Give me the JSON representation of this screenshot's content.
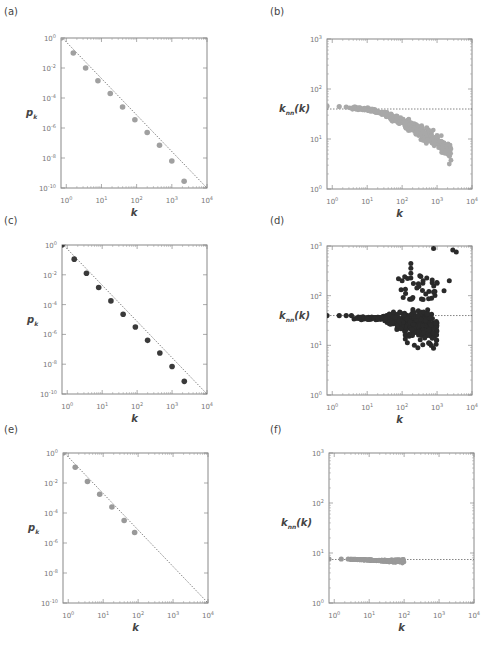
{
  "figure": {
    "panels": [
      {
        "id": "a",
        "label": "(a)",
        "type": "degree_distribution",
        "ylabel": "p",
        "ysub": "k",
        "xlabel": "k"
      },
      {
        "id": "b",
        "label": "(b)",
        "type": "knn",
        "ylabel": "k",
        "ysub": "nn",
        "ysuffix": "(k)",
        "xlabel": "k"
      },
      {
        "id": "c",
        "label": "(c)",
        "type": "degree_distribution",
        "ylabel": "p",
        "ysub": "k",
        "xlabel": "k"
      },
      {
        "id": "d",
        "label": "(d)",
        "type": "knn",
        "ylabel": "k",
        "ysub": "nn",
        "ysuffix": "(k)",
        "xlabel": "k"
      },
      {
        "id": "e",
        "label": "(e)",
        "type": "degree_distribution",
        "ylabel": "p",
        "ysub": "k",
        "xlabel": "k"
      },
      {
        "id": "f",
        "label": "(f)",
        "type": "knn",
        "ylabel": "k",
        "ysub": "nn",
        "ysuffix": "(k)",
        "xlabel": "k"
      }
    ]
  },
  "chart_data": [
    {
      "panel": "a",
      "type": "scatter",
      "title": "(a)",
      "xlabel": "k",
      "ylabel": "p_k",
      "xscale": "log",
      "yscale": "log",
      "xlim": [
        0.7,
        10000
      ],
      "ylim": [
        1e-10,
        1
      ],
      "xticks": [
        "10^0",
        "10^1",
        "10^2",
        "10^3",
        "10^4"
      ],
      "yticks": [
        "10^0",
        "10^-2",
        "10^-4",
        "10^-6",
        "10^-8",
        "10^-10"
      ],
      "marker_color": "#a0a0a0",
      "series": [
        {
          "name": "data",
          "x_log10": [
            -0.15,
            0.2,
            0.55,
            0.9,
            1.25,
            1.6,
            1.95,
            2.3,
            2.65,
            3.0,
            3.35
          ],
          "y_log10": [
            0.0,
            -1.0,
            -2.0,
            -2.85,
            -3.7,
            -4.6,
            -5.45,
            -6.3,
            -7.15,
            -8.2,
            -9.55
          ]
        }
      ],
      "reference_line": {
        "style": "dotted",
        "from_log10": [
          -0.15,
          0.1
        ],
        "to_log10": [
          4.0,
          -10.0
        ]
      }
    },
    {
      "panel": "b",
      "type": "scatter",
      "title": "(b)",
      "xlabel": "k",
      "ylabel": "k_nn(k)",
      "xscale": "log",
      "yscale": "log",
      "xlim": [
        0.7,
        10000
      ],
      "ylim": [
        1,
        1000
      ],
      "xticks": [
        "10^0",
        "10^1",
        "10^2",
        "10^3",
        "10^4"
      ],
      "yticks": [
        "10^0",
        "10^1",
        "10^2",
        "10^3"
      ],
      "marker_color": "#a8a8a8",
      "reference_line": {
        "style": "dotted",
        "y_log10": 1.6
      },
      "series": [
        {
          "name": "data",
          "description": "decreasing cloud from ~45 at k=1 to ~3 at k~2500"
        }
      ]
    },
    {
      "panel": "c",
      "type": "scatter",
      "title": "(c)",
      "xlabel": "k",
      "ylabel": "p_k",
      "xscale": "log",
      "yscale": "log",
      "xlim": [
        0.7,
        10000
      ],
      "ylim": [
        1e-10,
        1
      ],
      "xticks": [
        "10^0",
        "10^1",
        "10^2",
        "10^3",
        "10^4"
      ],
      "yticks": [
        "10^0",
        "10^-2",
        "10^-4",
        "10^-6",
        "10^-8",
        "10^-10"
      ],
      "marker_color": "#3a3a3a",
      "series": [
        {
          "name": "data",
          "x_log10": [
            -0.15,
            0.2,
            0.55,
            0.9,
            1.25,
            1.6,
            1.95,
            2.3,
            2.65,
            3.0,
            3.35
          ],
          "y_log10": [
            0.0,
            -0.95,
            -1.9,
            -2.85,
            -3.75,
            -4.65,
            -5.5,
            -6.4,
            -7.25,
            -8.15,
            -9.15
          ]
        }
      ],
      "reference_line": {
        "style": "dotted",
        "from_log10": [
          -0.15,
          0.1
        ],
        "to_log10": [
          4.0,
          -10.0
        ]
      }
    },
    {
      "panel": "d",
      "type": "scatter",
      "title": "(d)",
      "xlabel": "k",
      "ylabel": "k_nn(k)",
      "xscale": "log",
      "yscale": "log",
      "xlim": [
        0.7,
        10000
      ],
      "ylim": [
        1,
        1000
      ],
      "xticks": [
        "10^0",
        "10^1",
        "10^2",
        "10^3",
        "10^4"
      ],
      "yticks": [
        "10^0",
        "10^1",
        "10^2",
        "10^3"
      ],
      "marker_color": "#2a2a2a",
      "reference_line": {
        "style": "dotted",
        "y_log10": 1.6
      },
      "series": [
        {
          "name": "data",
          "description": "flat ~40 for small k, widening spread 7-500 around k~100-1000, outliers ~900 at k~700 and k~3000"
        }
      ]
    },
    {
      "panel": "e",
      "type": "scatter",
      "title": "(e)",
      "xlabel": "k",
      "ylabel": "p_k",
      "xscale": "log",
      "yscale": "log",
      "xlim": [
        0.7,
        10000
      ],
      "ylim": [
        1e-10,
        1
      ],
      "xticks": [
        "10^0",
        "10^1",
        "10^2",
        "10^3",
        "10^4"
      ],
      "yticks": [
        "10^0",
        "10^-2",
        "10^-4",
        "10^-6",
        "10^-8",
        "10^-10"
      ],
      "marker_color": "#999999",
      "series": [
        {
          "name": "data",
          "x_log10": [
            -0.15,
            0.2,
            0.55,
            0.9,
            1.25,
            1.6,
            1.9
          ],
          "y_log10": [
            0.0,
            -0.95,
            -1.9,
            -2.75,
            -3.6,
            -4.5,
            -5.3
          ]
        }
      ],
      "reference_line": {
        "style": "dotted",
        "from_log10": [
          -0.15,
          0.1
        ],
        "to_log10": [
          4.0,
          -10.0
        ]
      }
    },
    {
      "panel": "f",
      "type": "scatter",
      "title": "(f)",
      "xlabel": "k",
      "ylabel": "k_nn(k)",
      "xscale": "log",
      "yscale": "log",
      "xlim": [
        0.7,
        10000
      ],
      "ylim": [
        1,
        1000
      ],
      "xticks": [
        "10^0",
        "10^1",
        "10^2",
        "10^3",
        "10^4"
      ],
      "yticks": [
        "10^0",
        "10^1",
        "10^2",
        "10^3"
      ],
      "marker_color": "#999999",
      "reference_line": {
        "style": "dotted",
        "y_log10": 0.87
      },
      "series": [
        {
          "name": "data",
          "description": "flat at ~7.5 from k=1 to k~100"
        }
      ]
    }
  ]
}
